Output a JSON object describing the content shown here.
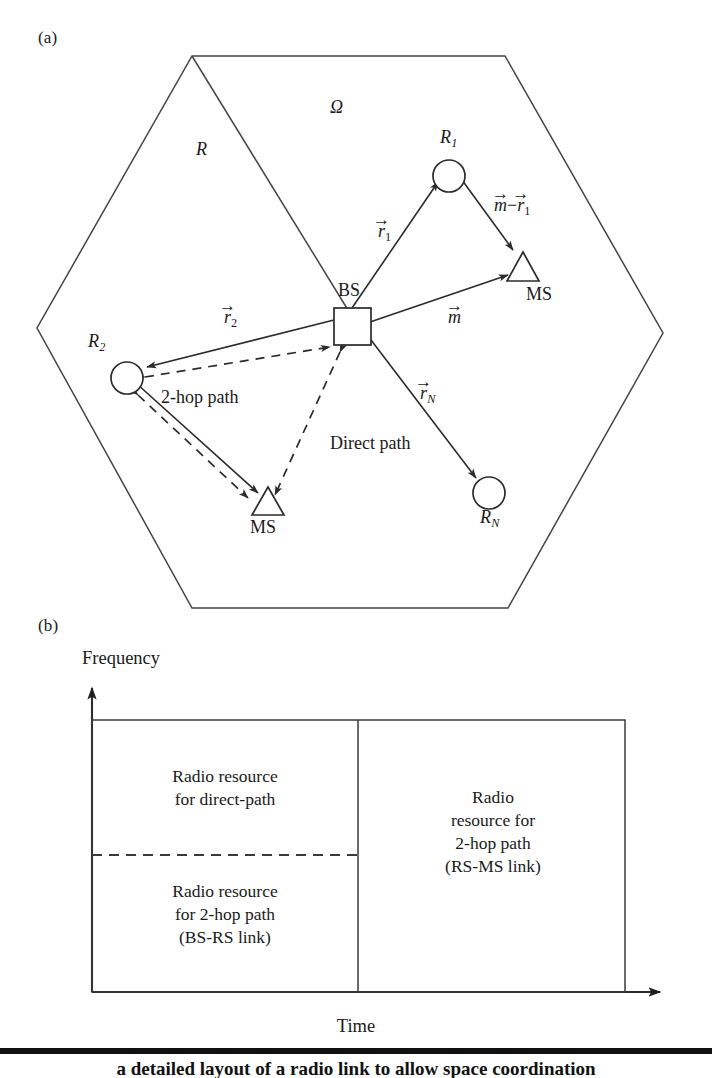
{
  "figure": {
    "panel_a": {
      "label": "(a)",
      "region_symbol": "Ω",
      "radius_label": "R",
      "base_station": {
        "label": "BS"
      },
      "relays": [
        {
          "name": "R1",
          "label_base": "R",
          "label_sub": "1"
        },
        {
          "name": "R2",
          "label_base": "R",
          "label_sub": "2"
        },
        {
          "name": "RN",
          "label_base": "R",
          "label_sub": "N"
        }
      ],
      "mobiles": [
        {
          "name": "MS-right",
          "label": "MS"
        },
        {
          "name": "MS-bottom",
          "label": "MS"
        }
      ],
      "vectors": [
        {
          "name": "r1",
          "base": "r",
          "sub": "1",
          "text": "r⃗1"
        },
        {
          "name": "r2",
          "base": "r",
          "sub": "2",
          "text": "r⃗2"
        },
        {
          "name": "rN",
          "base": "r",
          "sub": "N",
          "text": "r⃗N"
        },
        {
          "name": "m",
          "base": "m",
          "sub": "",
          "text": "m⃗"
        },
        {
          "name": "m-minus-r1",
          "base": "m−r",
          "sub": "1",
          "text": "m⃗−r⃗1"
        }
      ],
      "path_labels": {
        "two_hop": "2-hop path",
        "direct": "Direct path"
      }
    },
    "panel_b": {
      "label": "(b)",
      "y_axis_label": "Frequency",
      "x_axis_label": "Time",
      "regions": [
        {
          "name": "direct-path-resource",
          "lines": [
            "Radio resource",
            "for direct-path"
          ]
        },
        {
          "name": "two-hop-bs-rs-resource",
          "lines": [
            "Radio resource",
            "for 2-hop path",
            "(BS-RS link)"
          ]
        },
        {
          "name": "two-hop-rs-ms-resource",
          "lines": [
            "Radio",
            "resource for",
            "2-hop path",
            "(RS-MS link)"
          ]
        }
      ]
    },
    "caption": {
      "text": "a detailed layout of a radio link to allow space coordination"
    },
    "colors": {
      "ink": "#1a1a1a",
      "line": "#444444",
      "line_dark": "#2b2b2b",
      "background": "#ffffff",
      "rule": "#111111"
    }
  }
}
